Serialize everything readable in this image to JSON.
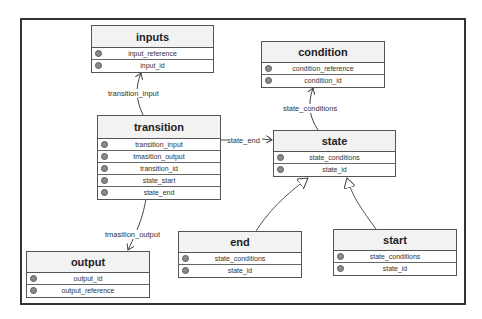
{
  "diagram": {
    "type": "uml-class-diagram",
    "entities": {
      "inputs": {
        "title": "inputs",
        "fields": [
          {
            "icon": "field-icon",
            "name": "input_reference"
          },
          {
            "icon": "field-icon",
            "name": "input_id"
          }
        ]
      },
      "condition": {
        "title": "condition",
        "fields": [
          {
            "icon": "field-icon",
            "name": "condition_reference"
          },
          {
            "icon": "field-icon",
            "name": "condition_id"
          }
        ]
      },
      "transition": {
        "title": "transition",
        "fields": [
          {
            "icon": "field-icon",
            "name": "transition_input"
          },
          {
            "icon": "field-icon",
            "name": "tmasition_output"
          },
          {
            "icon": "field-icon",
            "name": "transition_id"
          },
          {
            "icon": "field-icon",
            "name": "state_start"
          },
          {
            "icon": "field-icon",
            "name": "state_end"
          }
        ]
      },
      "state": {
        "title": "state",
        "fields": [
          {
            "icon": "field-icon",
            "name": "state_conditions"
          },
          {
            "icon": "field-icon",
            "name": "state_id"
          }
        ]
      },
      "output": {
        "title": "output",
        "fields": [
          {
            "icon": "field-icon",
            "name": "output_id"
          },
          {
            "icon": "field-icon",
            "name": "output_reference"
          }
        ]
      },
      "end": {
        "title": "end",
        "fields": [
          {
            "icon": "field-icon",
            "name": "state_conditions"
          },
          {
            "icon": "field-icon",
            "name": "state_id"
          }
        ]
      },
      "start": {
        "title": "start",
        "fields": [
          {
            "icon": "field-icon",
            "name": "state_conditions"
          },
          {
            "icon": "field-icon",
            "name": "state_id"
          }
        ]
      }
    },
    "edges": [
      {
        "from": "transition",
        "to": "inputs",
        "label": "transition_input",
        "kind": "association"
      },
      {
        "from": "transition",
        "to": "state",
        "label": "state_end",
        "kind": "association"
      },
      {
        "from": "transition",
        "to": "output",
        "label": "tmasition_output",
        "kind": "association"
      },
      {
        "from": "state",
        "to": "condition",
        "label": "state_conditions",
        "kind": "association"
      },
      {
        "from": "end",
        "to": "state",
        "label": "",
        "kind": "generalization"
      },
      {
        "from": "start",
        "to": "state",
        "label": "",
        "kind": "generalization"
      }
    ],
    "colors": {
      "border": "#555555",
      "header_bg": "#f2f2f2",
      "frame": "#333333",
      "icon": "#8a8a8a"
    }
  }
}
